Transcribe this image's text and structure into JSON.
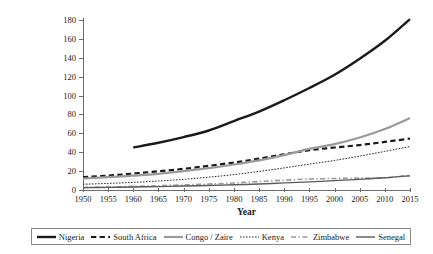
{
  "chart_data": {
    "type": "line",
    "title": "",
    "xlabel": "Year",
    "ylabel": "Total population (in millions)",
    "xlim": [
      1950,
      2015
    ],
    "ylim": [
      0,
      180
    ],
    "yticks": [
      0,
      20,
      40,
      60,
      80,
      100,
      120,
      140,
      160,
      180
    ],
    "xticks": [
      1950,
      1955,
      1960,
      1965,
      1970,
      1975,
      1980,
      1985,
      1990,
      1995,
      2000,
      2005,
      2010,
      2015
    ],
    "grid": false,
    "legend_position": "bottom",
    "series": [
      {
        "name": "Nigeria",
        "color": "#1a1a1a",
        "style": "solid",
        "width": 2.4,
        "x": [
          1960,
          1965,
          1970,
          1975,
          1980,
          1985,
          1990,
          1995,
          2000,
          2005,
          2010,
          2015
        ],
        "values": [
          45,
          50,
          56,
          63,
          73,
          83,
          95,
          108,
          122,
          139,
          158,
          181
        ]
      },
      {
        "name": "South Africa",
        "color": "#1a1a1a",
        "style": "dashed",
        "width": 2.2,
        "x": [
          1950,
          1955,
          1960,
          1965,
          1970,
          1975,
          1980,
          1985,
          1990,
          1995,
          2000,
          2005,
          2010,
          2015
        ],
        "values": [
          13.6,
          15.2,
          17.4,
          19.8,
          22.4,
          25.6,
          29.1,
          33.2,
          37.8,
          42.1,
          45.0,
          47.6,
          50.9,
          54.5
        ]
      },
      {
        "name": "Congo / Zaire",
        "color": "#9a9a9a",
        "style": "solid",
        "width": 2.2,
        "x": [
          1950,
          1955,
          1960,
          1965,
          1970,
          1975,
          1980,
          1985,
          1990,
          1995,
          2000,
          2005,
          2010,
          2015
        ],
        "values": [
          12.2,
          13.6,
          15.2,
          17.1,
          20.0,
          23.2,
          27.0,
          31.4,
          37.0,
          43.6,
          48.6,
          55.6,
          64.6,
          76.2
        ]
      },
      {
        "name": "Kenya",
        "color": "#2b2b2b",
        "style": "dotted",
        "width": 1.0,
        "x": [
          1950,
          1955,
          1960,
          1965,
          1970,
          1975,
          1980,
          1985,
          1990,
          1995,
          2000,
          2005,
          2010,
          2015
        ],
        "values": [
          6.1,
          7.0,
          8.1,
          9.5,
          11.3,
          13.6,
          16.3,
          19.7,
          23.4,
          27.4,
          31.3,
          35.9,
          40.9,
          46.1
        ]
      },
      {
        "name": "Zimbabwe",
        "color": "#9a9a9a",
        "style": "dashdot",
        "width": 1.6,
        "x": [
          1950,
          1955,
          1960,
          1965,
          1970,
          1975,
          1980,
          1985,
          1990,
          1995,
          2000,
          2005,
          2010,
          2015
        ],
        "values": [
          2.7,
          3.2,
          3.8,
          4.5,
          5.4,
          6.3,
          7.4,
          9.0,
          10.4,
          11.6,
          12.2,
          12.6,
          13.0,
          15.6
        ]
      },
      {
        "name": "Senegal",
        "color": "#5a5a5a",
        "style": "solid",
        "width": 1.4,
        "x": [
          1950,
          1955,
          1960,
          1965,
          1970,
          1975,
          1980,
          1985,
          1990,
          1995,
          2000,
          2005,
          2010,
          2015
        ],
        "values": [
          2.5,
          2.8,
          3.2,
          3.6,
          4.2,
          4.8,
          5.5,
          6.4,
          7.5,
          8.6,
          9.9,
          11.3,
          12.9,
          15.1
        ]
      }
    ]
  }
}
